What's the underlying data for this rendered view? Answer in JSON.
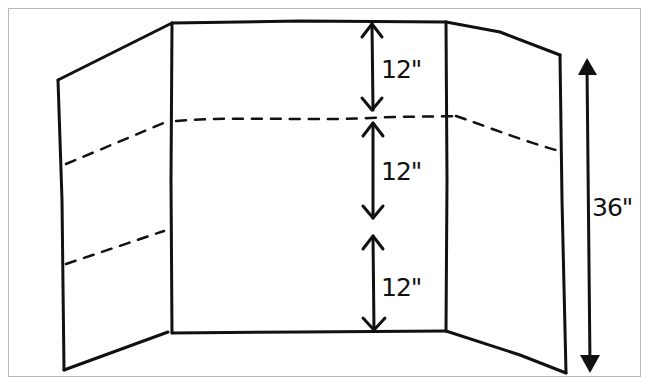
{
  "diagram": {
    "panels": [
      "left-wing",
      "center-panel",
      "right-wing"
    ],
    "fold_lines": "dashed",
    "segments": [
      {
        "label": "12\"",
        "position": "top"
      },
      {
        "label": "12\"",
        "position": "middle"
      },
      {
        "label": "12\"",
        "position": "bottom"
      }
    ],
    "total_height": {
      "label": "36\""
    },
    "colors": {
      "ink": "#111111",
      "frame": "#b8b8b8",
      "background": "#ffffff"
    }
  }
}
